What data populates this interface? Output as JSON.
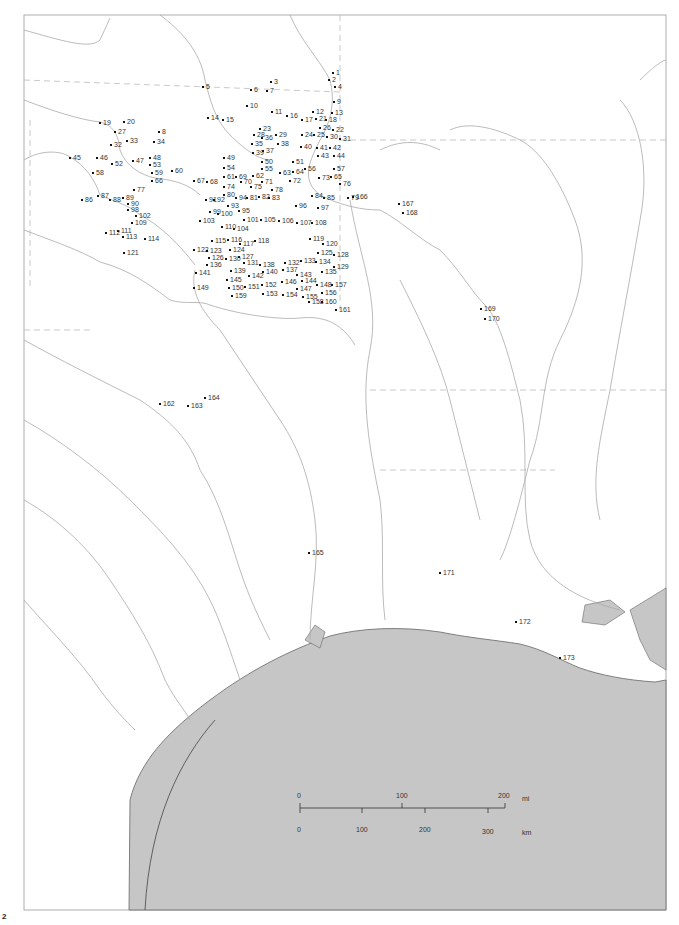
{
  "map": {
    "type": "site-location-map",
    "page_mark": "2",
    "scale_bar": {
      "miles": {
        "unit": "mi",
        "ticks": [
          "0",
          "100",
          "200"
        ]
      },
      "kilometers": {
        "unit": "km",
        "ticks": [
          "0",
          "100",
          "200",
          "300"
        ]
      }
    },
    "sites": [
      {
        "id": "1",
        "x": 333,
        "y": 72
      },
      {
        "id": "2",
        "x": 329,
        "y": 79
      },
      {
        "id": "3",
        "x": 271,
        "y": 81
      },
      {
        "id": "4",
        "x": 335,
        "y": 86
      },
      {
        "id": "5",
        "x": 203,
        "y": 86
      },
      {
        "id": "6",
        "x": 251,
        "y": 89
      },
      {
        "id": "7",
        "x": 267,
        "y": 90
      },
      {
        "id": "8",
        "x": 159,
        "y": 131
      },
      {
        "id": "9",
        "x": 334,
        "y": 101
      },
      {
        "id": "10",
        "x": 247,
        "y": 105
      },
      {
        "id": "11",
        "x": 272,
        "y": 111
      },
      {
        "id": "12",
        "x": 313,
        "y": 111
      },
      {
        "id": "13",
        "x": 332,
        "y": 112
      },
      {
        "id": "14",
        "x": 208,
        "y": 117
      },
      {
        "id": "15",
        "x": 223,
        "y": 119
      },
      {
        "id": "16",
        "x": 287,
        "y": 115
      },
      {
        "id": "17",
        "x": 302,
        "y": 119
      },
      {
        "id": "18",
        "x": 326,
        "y": 119
      },
      {
        "id": "19",
        "x": 100,
        "y": 122
      },
      {
        "id": "20",
        "x": 124,
        "y": 121
      },
      {
        "id": "21",
        "x": 316,
        "y": 118
      },
      {
        "id": "22",
        "x": 333,
        "y": 129
      },
      {
        "id": "23",
        "x": 260,
        "y": 128
      },
      {
        "id": "24",
        "x": 302,
        "y": 134
      },
      {
        "id": "25",
        "x": 314,
        "y": 134
      },
      {
        "id": "26",
        "x": 320,
        "y": 127
      },
      {
        "id": "27",
        "x": 115,
        "y": 131
      },
      {
        "id": "28",
        "x": 254,
        "y": 134
      },
      {
        "id": "29",
        "x": 276,
        "y": 134
      },
      {
        "id": "30",
        "x": 327,
        "y": 136
      },
      {
        "id": "31",
        "x": 340,
        "y": 138
      },
      {
        "id": "32",
        "x": 111,
        "y": 144
      },
      {
        "id": "33",
        "x": 127,
        "y": 140
      },
      {
        "id": "34",
        "x": 154,
        "y": 141
      },
      {
        "id": "35",
        "x": 252,
        "y": 143
      },
      {
        "id": "36",
        "x": 262,
        "y": 137
      },
      {
        "id": "37",
        "x": 263,
        "y": 150
      },
      {
        "id": "38",
        "x": 278,
        "y": 143
      },
      {
        "id": "39",
        "x": 253,
        "y": 152
      },
      {
        "id": "40",
        "x": 301,
        "y": 146
      },
      {
        "id": "41",
        "x": 317,
        "y": 147
      },
      {
        "id": "42",
        "x": 330,
        "y": 147
      },
      {
        "id": "43",
        "x": 318,
        "y": 155
      },
      {
        "id": "44",
        "x": 334,
        "y": 155
      },
      {
        "id": "45",
        "x": 70,
        "y": 157
      },
      {
        "id": "46",
        "x": 97,
        "y": 157
      },
      {
        "id": "47",
        "x": 133,
        "y": 160
      },
      {
        "id": "48",
        "x": 150,
        "y": 157
      },
      {
        "id": "49",
        "x": 224,
        "y": 157
      },
      {
        "id": "50",
        "x": 262,
        "y": 161
      },
      {
        "id": "51",
        "x": 293,
        "y": 161
      },
      {
        "id": "52",
        "x": 112,
        "y": 163
      },
      {
        "id": "53",
        "x": 150,
        "y": 164
      },
      {
        "id": "54",
        "x": 224,
        "y": 167
      },
      {
        "id": "55",
        "x": 262,
        "y": 168
      },
      {
        "id": "56",
        "x": 305,
        "y": 168
      },
      {
        "id": "57",
        "x": 334,
        "y": 168
      },
      {
        "id": "58",
        "x": 93,
        "y": 172
      },
      {
        "id": "59",
        "x": 152,
        "y": 172
      },
      {
        "id": "60",
        "x": 172,
        "y": 170
      },
      {
        "id": "61",
        "x": 224,
        "y": 176
      },
      {
        "id": "62",
        "x": 253,
        "y": 175
      },
      {
        "id": "63",
        "x": 280,
        "y": 172
      },
      {
        "id": "64",
        "x": 293,
        "y": 171
      },
      {
        "id": "65",
        "x": 331,
        "y": 176
      },
      {
        "id": "66",
        "x": 152,
        "y": 180
      },
      {
        "id": "67",
        "x": 194,
        "y": 180
      },
      {
        "id": "68",
        "x": 207,
        "y": 181
      },
      {
        "id": "69",
        "x": 236,
        "y": 176
      },
      {
        "id": "70",
        "x": 241,
        "y": 181
      },
      {
        "id": "71",
        "x": 262,
        "y": 181
      },
      {
        "id": "72",
        "x": 290,
        "y": 180
      },
      {
        "id": "73",
        "x": 319,
        "y": 177
      },
      {
        "id": "74",
        "x": 224,
        "y": 186
      },
      {
        "id": "75",
        "x": 251,
        "y": 186
      },
      {
        "id": "76",
        "x": 340,
        "y": 183
      },
      {
        "id": "77",
        "x": 134,
        "y": 189
      },
      {
        "id": "78",
        "x": 272,
        "y": 189
      },
      {
        "id": "79",
        "x": 348,
        "y": 197
      },
      {
        "id": "80",
        "x": 224,
        "y": 194
      },
      {
        "id": "81",
        "x": 247,
        "y": 197
      },
      {
        "id": "82",
        "x": 259,
        "y": 196
      },
      {
        "id": "83",
        "x": 269,
        "y": 197
      },
      {
        "id": "84",
        "x": 312,
        "y": 195
      },
      {
        "id": "85",
        "x": 324,
        "y": 197
      },
      {
        "id": "86",
        "x": 82,
        "y": 199
      },
      {
        "id": "87",
        "x": 98,
        "y": 195
      },
      {
        "id": "88",
        "x": 110,
        "y": 199
      },
      {
        "id": "89",
        "x": 123,
        "y": 197
      },
      {
        "id": "90",
        "x": 128,
        "y": 203
      },
      {
        "id": "91",
        "x": 206,
        "y": 199
      },
      {
        "id": "92",
        "x": 214,
        "y": 199
      },
      {
        "id": "93",
        "x": 228,
        "y": 205
      },
      {
        "id": "94",
        "x": 236,
        "y": 197
      },
      {
        "id": "95",
        "x": 239,
        "y": 210
      },
      {
        "id": "96",
        "x": 296,
        "y": 205
      },
      {
        "id": "97",
        "x": 318,
        "y": 207
      },
      {
        "id": "98",
        "x": 128,
        "y": 209
      },
      {
        "id": "99",
        "x": 210,
        "y": 211
      },
      {
        "id": "100",
        "x": 218,
        "y": 213
      },
      {
        "id": "101",
        "x": 244,
        "y": 219
      },
      {
        "id": "102",
        "x": 136,
        "y": 215
      },
      {
        "id": "103",
        "x": 200,
        "y": 220
      },
      {
        "id": "104",
        "x": 234,
        "y": 228
      },
      {
        "id": "105",
        "x": 261,
        "y": 219
      },
      {
        "id": "106",
        "x": 279,
        "y": 220
      },
      {
        "id": "107",
        "x": 297,
        "y": 222
      },
      {
        "id": "108",
        "x": 312,
        "y": 222
      },
      {
        "id": "109",
        "x": 132,
        "y": 222
      },
      {
        "id": "110",
        "x": 222,
        "y": 226
      },
      {
        "id": "111",
        "x": 118,
        "y": 230
      },
      {
        "id": "112",
        "x": 106,
        "y": 232
      },
      {
        "id": "113",
        "x": 123,
        "y": 236
      },
      {
        "id": "114",
        "x": 145,
        "y": 238
      },
      {
        "id": "115",
        "x": 212,
        "y": 240
      },
      {
        "id": "116",
        "x": 228,
        "y": 239
      },
      {
        "id": "117",
        "x": 240,
        "y": 243
      },
      {
        "id": "118",
        "x": 255,
        "y": 240
      },
      {
        "id": "119",
        "x": 310,
        "y": 238
      },
      {
        "id": "120",
        "x": 323,
        "y": 243
      },
      {
        "id": "121",
        "x": 124,
        "y": 252
      },
      {
        "id": "122",
        "x": 194,
        "y": 249
      },
      {
        "id": "123",
        "x": 207,
        "y": 250
      },
      {
        "id": "124",
        "x": 230,
        "y": 249
      },
      {
        "id": "125",
        "x": 318,
        "y": 252
      },
      {
        "id": "126",
        "x": 209,
        "y": 257
      },
      {
        "id": "127",
        "x": 239,
        "y": 256
      },
      {
        "id": "128",
        "x": 334,
        "y": 254
      },
      {
        "id": "129",
        "x": 334,
        "y": 266
      },
      {
        "id": "130",
        "x": 226,
        "y": 258
      },
      {
        "id": "131",
        "x": 244,
        "y": 262
      },
      {
        "id": "132",
        "x": 285,
        "y": 262
      },
      {
        "id": "133",
        "x": 301,
        "y": 260
      },
      {
        "id": "134",
        "x": 316,
        "y": 261
      },
      {
        "id": "135",
        "x": 322,
        "y": 271
      },
      {
        "id": "136",
        "x": 207,
        "y": 264
      },
      {
        "id": "137",
        "x": 283,
        "y": 269
      },
      {
        "id": "138",
        "x": 260,
        "y": 264
      },
      {
        "id": "139",
        "x": 231,
        "y": 270
      },
      {
        "id": "140",
        "x": 263,
        "y": 271
      },
      {
        "id": "141",
        "x": 196,
        "y": 272
      },
      {
        "id": "142",
        "x": 249,
        "y": 275
      },
      {
        "id": "143",
        "x": 297,
        "y": 274
      },
      {
        "id": "144",
        "x": 302,
        "y": 280
      },
      {
        "id": "145",
        "x": 227,
        "y": 279
      },
      {
        "id": "146",
        "x": 282,
        "y": 281
      },
      {
        "id": "147",
        "x": 297,
        "y": 288
      },
      {
        "id": "148",
        "x": 317,
        "y": 284
      },
      {
        "id": "149",
        "x": 194,
        "y": 287
      },
      {
        "id": "150",
        "x": 229,
        "y": 287
      },
      {
        "id": "151",
        "x": 245,
        "y": 286
      },
      {
        "id": "152",
        "x": 262,
        "y": 284
      },
      {
        "id": "153",
        "x": 263,
        "y": 293
      },
      {
        "id": "154",
        "x": 283,
        "y": 294
      },
      {
        "id": "155",
        "x": 303,
        "y": 296
      },
      {
        "id": "156",
        "x": 322,
        "y": 292
      },
      {
        "id": "157",
        "x": 332,
        "y": 284
      },
      {
        "id": "158",
        "x": 309,
        "y": 301
      },
      {
        "id": "159",
        "x": 232,
        "y": 295
      },
      {
        "id": "160",
        "x": 322,
        "y": 301
      },
      {
        "id": "161",
        "x": 336,
        "y": 309
      },
      {
        "id": "162",
        "x": 160,
        "y": 403
      },
      {
        "id": "163",
        "x": 188,
        "y": 405
      },
      {
        "id": "164",
        "x": 205,
        "y": 397
      },
      {
        "id": "165",
        "x": 309,
        "y": 552
      },
      {
        "id": "166",
        "x": 353,
        "y": 196
      },
      {
        "id": "167",
        "x": 399,
        "y": 203
      },
      {
        "id": "168",
        "x": 403,
        "y": 212
      },
      {
        "id": "169",
        "x": 481,
        "y": 308
      },
      {
        "id": "170",
        "x": 485,
        "y": 318
      },
      {
        "id": "171",
        "x": 440,
        "y": 572
      },
      {
        "id": "172",
        "x": 516,
        "y": 621
      },
      {
        "id": "173",
        "x": 560,
        "y": 657
      }
    ]
  }
}
